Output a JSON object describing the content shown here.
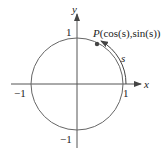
{
  "diagram": {
    "type": "unit-circle",
    "axes": {
      "x_label": "x",
      "y_label": "y"
    },
    "ticks": {
      "x_pos": "1",
      "x_neg": "−1",
      "y_pos": "1",
      "y_neg": "−1"
    },
    "point": {
      "name": "P",
      "label_prefix": "P",
      "label_coords": "(cos(s),sin(s))"
    },
    "arc_label": "s",
    "colors": {
      "stroke": "#555555",
      "text": "#222222",
      "point": "#444444"
    }
  }
}
